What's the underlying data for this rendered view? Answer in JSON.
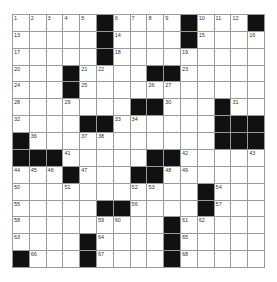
{
  "puzzle": {
    "rows": 15,
    "cols": 15,
    "colors": {
      "block": "#111111",
      "cell": "#ffffff",
      "line": "#9a9a9a"
    },
    "grid": [
      "#####X#####X###X",
      "placeholder"
    ],
    "layout": [
      ".....#....#...#",
      ".....#....#....",
      ".....#.........",
      "...#....##.....",
      "...#...........",
      ".......##...#..",
      "....##......###",
      "#...........##X",
      "###.....##.....",
      "...#...##......",
      "...........#...",
      ".....##....#...",
      ".........#.....",
      "....#....#.....",
      "#...#....#....."
    ],
    "numbers": [
      {
        "r": 0,
        "c": 0,
        "n": "1"
      },
      {
        "r": 0,
        "c": 1,
        "n": "2"
      },
      {
        "r": 0,
        "c": 2,
        "n": "3"
      },
      {
        "r": 0,
        "c": 3,
        "n": "4"
      },
      {
        "r": 0,
        "c": 4,
        "n": "5"
      },
      {
        "r": 0,
        "c": 6,
        "n": "6"
      },
      {
        "r": 0,
        "c": 7,
        "n": "7"
      },
      {
        "r": 0,
        "c": 8,
        "n": "8"
      },
      {
        "r": 0,
        "c": 9,
        "n": "9"
      },
      {
        "r": 0,
        "c": 11,
        "n": "10"
      },
      {
        "r": 0,
        "c": 12,
        "n": "11"
      },
      {
        "r": 0,
        "c": 13,
        "n": "12"
      },
      {
        "r": 1,
        "c": 0,
        "n": "13"
      },
      {
        "r": 1,
        "c": 6,
        "n": "14"
      },
      {
        "r": 1,
        "c": 11,
        "n": "15"
      },
      {
        "r": 1,
        "c": 14,
        "n": "16"
      },
      {
        "r": 2,
        "c": 0,
        "n": "17"
      },
      {
        "r": 2,
        "c": 6,
        "n": "18"
      },
      {
        "r": 2,
        "c": 10,
        "n": "19"
      },
      {
        "r": 3,
        "c": 0,
        "n": "20"
      },
      {
        "r": 3,
        "c": 4,
        "n": "21"
      },
      {
        "r": 3,
        "c": 5,
        "n": "22"
      },
      {
        "r": 3,
        "c": 10,
        "n": "23"
      },
      {
        "r": 4,
        "c": 0,
        "n": "24"
      },
      {
        "r": 4,
        "c": 4,
        "n": "25"
      },
      {
        "r": 4,
        "c": 8,
        "n": "26"
      },
      {
        "r": 4,
        "c": 9,
        "n": "27"
      },
      {
        "r": 5,
        "c": 0,
        "n": "28"
      },
      {
        "r": 5,
        "c": 3,
        "n": "29"
      },
      {
        "r": 5,
        "c": 9,
        "n": "30"
      },
      {
        "r": 5,
        "c": 13,
        "n": "31"
      },
      {
        "r": 6,
        "c": 0,
        "n": "32"
      },
      {
        "r": 6,
        "c": 6,
        "n": "33"
      },
      {
        "r": 6,
        "c": 7,
        "n": "34"
      },
      {
        "r": 6,
        "c": 12,
        "n": "35"
      },
      {
        "r": 7,
        "c": 1,
        "n": "36"
      },
      {
        "r": 7,
        "c": 4,
        "n": "37"
      },
      {
        "r": 7,
        "c": 5,
        "n": "38"
      },
      {
        "r": 7,
        "c": 12,
        "n": "39"
      },
      {
        "r": 7,
        "c": 13,
        "n": "40"
      },
      {
        "r": 8,
        "c": 3,
        "n": "41"
      },
      {
        "r": 8,
        "c": 10,
        "n": "42"
      },
      {
        "r": 8,
        "c": 14,
        "n": "43"
      },
      {
        "r": 9,
        "c": 0,
        "n": "44"
      },
      {
        "r": 9,
        "c": 1,
        "n": "45"
      },
      {
        "r": 9,
        "c": 2,
        "n": "46"
      },
      {
        "r": 9,
        "c": 4,
        "n": "47"
      },
      {
        "r": 9,
        "c": 9,
        "n": "48"
      },
      {
        "r": 9,
        "c": 10,
        "n": "49"
      },
      {
        "r": 10,
        "c": 0,
        "n": "50"
      },
      {
        "r": 10,
        "c": 3,
        "n": "51"
      },
      {
        "r": 10,
        "c": 7,
        "n": "52"
      },
      {
        "r": 10,
        "c": 8,
        "n": "53"
      },
      {
        "r": 10,
        "c": 12,
        "n": "54"
      },
      {
        "r": 11,
        "c": 0,
        "n": "55"
      },
      {
        "r": 11,
        "c": 7,
        "n": "56"
      },
      {
        "r": 11,
        "c": 12,
        "n": "57"
      },
      {
        "r": 12,
        "c": 0,
        "n": "58"
      },
      {
        "r": 12,
        "c": 5,
        "n": "59"
      },
      {
        "r": 12,
        "c": 6,
        "n": "60"
      },
      {
        "r": 12,
        "c": 10,
        "n": "61"
      },
      {
        "r": 12,
        "c": 11,
        "n": "62"
      },
      {
        "r": 13,
        "c": 0,
        "n": "63"
      },
      {
        "r": 13,
        "c": 5,
        "n": "64"
      },
      {
        "r": 13,
        "c": 10,
        "n": "65"
      },
      {
        "r": 14,
        "c": 1,
        "n": "66"
      },
      {
        "r": 14,
        "c": 5,
        "n": "67"
      },
      {
        "r": 14,
        "c": 10,
        "n": "68"
      }
    ]
  }
}
